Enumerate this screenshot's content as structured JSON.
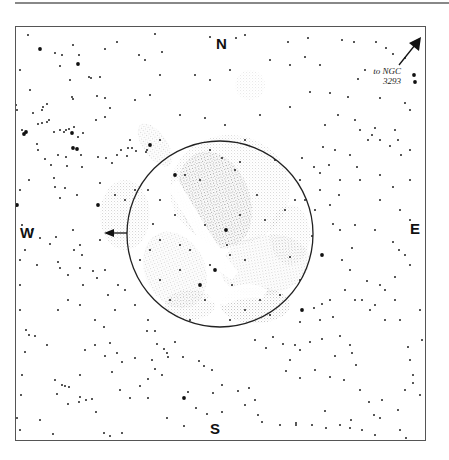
{
  "chart": {
    "title": "",
    "cardinals": {
      "north": "N",
      "south": "S",
      "east": "E",
      "west": "W"
    },
    "annotation": {
      "line1": "to NGC",
      "line2": "3293"
    },
    "field_circle": {
      "cx": 220,
      "cy": 234,
      "r": 93
    },
    "colors": {
      "ink": "#111111",
      "nebula": "#9a9a9a",
      "frame": "#555555"
    }
  },
  "stars": [
    [
      28,
      35,
      1
    ],
    [
      40,
      49,
      2
    ],
    [
      55,
      53,
      1
    ],
    [
      62,
      55,
      1
    ],
    [
      73,
      45,
      1
    ],
    [
      79,
      55,
      1
    ],
    [
      105,
      49,
      1
    ],
    [
      117,
      42,
      1
    ],
    [
      139,
      55,
      1
    ],
    [
      155,
      34,
      1
    ],
    [
      162,
      52,
      1
    ],
    [
      210,
      37,
      1
    ],
    [
      236,
      38,
      1
    ],
    [
      245,
      35,
      1
    ],
    [
      288,
      42,
      1
    ],
    [
      308,
      38,
      1
    ],
    [
      342,
      40,
      1
    ],
    [
      354,
      42,
      1
    ],
    [
      376,
      42,
      1
    ],
    [
      386,
      48,
      1
    ],
    [
      393,
      54,
      1
    ],
    [
      405,
      58,
      1
    ],
    [
      78,
      64,
      2
    ],
    [
      89,
      77,
      1
    ],
    [
      91,
      78,
      1
    ],
    [
      60,
      66,
      1
    ],
    [
      70,
      80,
      1
    ],
    [
      100,
      77,
      1
    ],
    [
      145,
      60,
      1
    ],
    [
      160,
      75,
      1
    ],
    [
      195,
      75,
      1
    ],
    [
      210,
      80,
      1
    ],
    [
      230,
      70,
      1
    ],
    [
      270,
      60,
      1
    ],
    [
      290,
      65,
      1
    ],
    [
      305,
      57,
      1
    ],
    [
      320,
      65,
      1
    ],
    [
      358,
      79,
      1
    ],
    [
      365,
      70,
      1
    ],
    [
      414,
      75,
      2
    ],
    [
      415,
      82,
      2
    ],
    [
      20,
      70,
      1
    ],
    [
      30,
      90,
      1
    ],
    [
      42,
      110,
      1
    ],
    [
      47,
      104,
      1
    ],
    [
      43,
      107,
      1
    ],
    [
      72,
      97,
      1
    ],
    [
      73,
      99,
      1
    ],
    [
      97,
      96,
      1
    ],
    [
      105,
      98,
      1
    ],
    [
      110,
      108,
      1
    ],
    [
      135,
      100,
      1
    ],
    [
      150,
      95,
      1
    ],
    [
      180,
      115,
      1
    ],
    [
      205,
      118,
      1
    ],
    [
      225,
      125,
      1
    ],
    [
      260,
      115,
      1
    ],
    [
      290,
      107,
      1
    ],
    [
      310,
      92,
      1
    ],
    [
      330,
      93,
      1
    ],
    [
      348,
      97,
      1
    ],
    [
      380,
      98,
      1
    ],
    [
      405,
      103,
      1
    ],
    [
      410,
      110,
      1
    ],
    [
      17,
      110,
      1
    ],
    [
      22,
      130,
      1
    ],
    [
      16,
      105,
      1
    ],
    [
      33,
      113,
      1
    ],
    [
      38,
      124,
      1
    ],
    [
      42,
      123,
      1
    ],
    [
      47,
      122,
      1
    ],
    [
      49,
      120,
      1
    ],
    [
      54,
      132,
      1
    ],
    [
      60,
      130,
      1
    ],
    [
      64,
      132,
      1
    ],
    [
      66,
      130,
      1
    ],
    [
      69,
      129,
      1
    ],
    [
      72,
      133,
      1
    ],
    [
      74,
      127,
      1
    ],
    [
      78,
      137,
      1
    ],
    [
      83,
      133,
      1
    ],
    [
      24,
      134,
      2
    ],
    [
      26,
      132,
      2
    ],
    [
      72,
      133,
      2
    ],
    [
      73,
      148,
      2
    ],
    [
      77,
      149,
      2
    ],
    [
      37,
      144,
      1
    ],
    [
      38,
      150,
      1
    ],
    [
      45,
      159,
      1
    ],
    [
      58,
      155,
      1
    ],
    [
      66,
      157,
      1
    ],
    [
      81,
      155,
      1
    ],
    [
      51,
      165,
      1
    ],
    [
      54,
      178,
      1
    ],
    [
      67,
      166,
      1
    ],
    [
      82,
      167,
      1
    ],
    [
      29,
      180,
      1
    ],
    [
      55,
      187,
      1
    ],
    [
      65,
      188,
      1
    ],
    [
      77,
      195,
      1
    ],
    [
      98,
      157,
      1
    ],
    [
      117,
      155,
      1
    ],
    [
      127,
      156,
      1
    ],
    [
      128,
      148,
      1
    ],
    [
      136,
      151,
      1
    ],
    [
      146,
      152,
      1
    ],
    [
      147,
      150,
      1
    ],
    [
      96,
      120,
      1
    ],
    [
      105,
      117,
      1
    ],
    [
      121,
      150,
      1
    ],
    [
      130,
      140,
      1
    ],
    [
      132,
      148,
      1
    ],
    [
      106,
      158,
      1
    ],
    [
      112,
      163,
      1
    ],
    [
      100,
      183,
      1
    ],
    [
      115,
      195,
      1
    ],
    [
      125,
      200,
      1
    ],
    [
      135,
      190,
      1
    ],
    [
      148,
      190,
      1
    ],
    [
      60,
      198,
      1
    ],
    [
      150,
      145,
      2
    ],
    [
      160,
      140,
      1
    ],
    [
      325,
      125,
      1
    ],
    [
      338,
      115,
      1
    ],
    [
      355,
      120,
      1
    ],
    [
      360,
      130,
      1
    ],
    [
      375,
      128,
      1
    ],
    [
      372,
      135,
      1
    ],
    [
      368,
      140,
      1
    ],
    [
      380,
      140,
      1
    ],
    [
      395,
      130,
      1
    ],
    [
      398,
      140,
      1
    ],
    [
      410,
      150,
      1
    ],
    [
      323,
      147,
      1
    ],
    [
      335,
      150,
      1
    ],
    [
      350,
      155,
      1
    ],
    [
      390,
      146,
      1
    ],
    [
      401,
      155,
      1
    ],
    [
      357,
      167,
      1
    ],
    [
      329,
      165,
      1
    ],
    [
      320,
      173,
      1
    ],
    [
      302,
      158,
      1
    ],
    [
      314,
      167,
      1
    ],
    [
      320,
      190,
      1
    ],
    [
      340,
      180,
      1
    ],
    [
      360,
      180,
      1
    ],
    [
      380,
      175,
      1
    ],
    [
      393,
      187,
      1
    ],
    [
      410,
      180,
      1
    ],
    [
      339,
      195,
      1
    ],
    [
      380,
      200,
      1
    ],
    [
      400,
      210,
      1
    ],
    [
      410,
      220,
      1
    ],
    [
      330,
      205,
      1
    ],
    [
      305,
      200,
      1
    ],
    [
      315,
      210,
      1
    ],
    [
      333,
      224,
      1
    ],
    [
      340,
      230,
      1
    ],
    [
      355,
      225,
      1
    ],
    [
      375,
      230,
      1
    ],
    [
      393,
      242,
      1
    ],
    [
      399,
      250,
      1
    ],
    [
      405,
      255,
      1
    ],
    [
      410,
      265,
      1
    ],
    [
      312,
      236,
      1
    ],
    [
      342,
      260,
      1
    ],
    [
      352,
      248,
      1
    ],
    [
      20,
      190,
      1
    ],
    [
      22,
      225,
      1
    ],
    [
      32,
      230,
      1
    ],
    [
      40,
      238,
      1
    ],
    [
      50,
      244,
      1
    ],
    [
      56,
      237,
      1
    ],
    [
      73,
      230,
      1
    ],
    [
      80,
      245,
      1
    ],
    [
      74,
      250,
      1
    ],
    [
      82,
      255,
      1
    ],
    [
      20,
      260,
      1
    ],
    [
      37,
      265,
      1
    ],
    [
      58,
      262,
      1
    ],
    [
      60,
      268,
      1
    ],
    [
      80,
      268,
      1
    ],
    [
      20,
      285,
      1
    ],
    [
      25,
      250,
      1
    ],
    [
      68,
      275,
      1
    ],
    [
      93,
      271,
      1
    ],
    [
      83,
      285,
      1
    ],
    [
      97,
      278,
      1
    ],
    [
      105,
      270,
      1
    ],
    [
      100,
      240,
      1
    ],
    [
      98,
      205,
      2
    ],
    [
      17,
      205,
      2
    ],
    [
      20,
      310,
      1
    ],
    [
      26,
      330,
      1
    ],
    [
      29,
      335,
      1
    ],
    [
      35,
      336,
      1
    ],
    [
      47,
      345,
      1
    ],
    [
      25,
      352,
      1
    ],
    [
      22,
      375,
      1
    ],
    [
      21,
      395,
      1
    ],
    [
      40,
      420,
      1
    ],
    [
      55,
      380,
      1
    ],
    [
      62,
      385,
      1
    ],
    [
      65,
      386,
      1
    ],
    [
      69,
      387,
      1
    ],
    [
      57,
      394,
      1
    ],
    [
      68,
      404,
      1
    ],
    [
      79,
      402,
      1
    ],
    [
      80,
      397,
      1
    ],
    [
      86,
      400,
      1
    ],
    [
      92,
      399,
      1
    ],
    [
      96,
      412,
      1
    ],
    [
      104,
      433,
      1
    ],
    [
      122,
      433,
      1
    ],
    [
      110,
      436,
      1
    ],
    [
      53,
      434,
      1
    ],
    [
      20,
      430,
      1
    ],
    [
      17,
      418,
      1
    ],
    [
      58,
      310,
      1
    ],
    [
      68,
      300,
      1
    ],
    [
      80,
      305,
      1
    ],
    [
      95,
      320,
      1
    ],
    [
      104,
      327,
      1
    ],
    [
      110,
      343,
      1
    ],
    [
      117,
      353,
      1
    ],
    [
      122,
      362,
      1
    ],
    [
      135,
      358,
      1
    ],
    [
      148,
      379,
      1
    ],
    [
      140,
      386,
      1
    ],
    [
      130,
      398,
      1
    ],
    [
      148,
      398,
      1
    ],
    [
      95,
      345,
      1
    ],
    [
      85,
      350,
      1
    ],
    [
      80,
      375,
      1
    ],
    [
      115,
      310,
      1
    ],
    [
      108,
      295,
      1
    ],
    [
      125,
      290,
      1
    ],
    [
      118,
      285,
      1
    ],
    [
      105,
      356,
      1
    ],
    [
      112,
      372,
      1
    ],
    [
      120,
      390,
      1
    ],
    [
      147,
      331,
      1
    ],
    [
      155,
      331,
      1
    ],
    [
      157,
      344,
      1
    ],
    [
      164,
      349,
      1
    ],
    [
      167,
      353,
      1
    ],
    [
      168,
      357,
      1
    ],
    [
      152,
      360,
      1
    ],
    [
      155,
      369,
      1
    ],
    [
      162,
      375,
      1
    ],
    [
      175,
      342,
      1
    ],
    [
      184,
      398,
      2
    ],
    [
      188,
      392,
      1
    ],
    [
      183,
      357,
      1
    ],
    [
      199,
      361,
      1
    ],
    [
      204,
      366,
      1
    ],
    [
      212,
      370,
      1
    ],
    [
      222,
      385,
      1
    ],
    [
      213,
      393,
      1
    ],
    [
      238,
      391,
      1
    ],
    [
      249,
      388,
      1
    ],
    [
      255,
      400,
      1
    ],
    [
      245,
      405,
      1
    ],
    [
      222,
      412,
      1
    ],
    [
      196,
      408,
      1
    ],
    [
      167,
      418,
      1
    ],
    [
      184,
      426,
      1
    ],
    [
      207,
      414,
      1
    ],
    [
      255,
      340,
      1
    ],
    [
      266,
      348,
      1
    ],
    [
      273,
      337,
      1
    ],
    [
      283,
      344,
      1
    ],
    [
      295,
      345,
      1
    ],
    [
      310,
      342,
      1
    ],
    [
      322,
      339,
      1
    ],
    [
      300,
      350,
      1
    ],
    [
      290,
      360,
      1
    ],
    [
      286,
      371,
      1
    ],
    [
      300,
      378,
      1
    ],
    [
      315,
      370,
      1
    ],
    [
      340,
      336,
      1
    ],
    [
      350,
      345,
      1
    ],
    [
      352,
      353,
      1
    ],
    [
      335,
      356,
      1
    ],
    [
      330,
      377,
      1
    ],
    [
      356,
      365,
      1
    ],
    [
      344,
      380,
      1
    ],
    [
      360,
      390,
      1
    ],
    [
      369,
      402,
      1
    ],
    [
      382,
      400,
      1
    ],
    [
      374,
      415,
      1
    ],
    [
      351,
      420,
      1
    ],
    [
      326,
      428,
      1
    ],
    [
      350,
      428,
      1
    ],
    [
      380,
      418,
      1
    ],
    [
      398,
      410,
      1
    ],
    [
      405,
      390,
      1
    ],
    [
      413,
      383,
      1
    ],
    [
      413,
      375,
      1
    ],
    [
      410,
      360,
      1
    ],
    [
      408,
      347,
      1
    ],
    [
      258,
      415,
      1
    ],
    [
      262,
      422,
      1
    ],
    [
      280,
      425,
      1
    ],
    [
      296,
      423,
      1
    ],
    [
      296,
      425,
      1
    ],
    [
      312,
      425,
      1
    ],
    [
      325,
      411,
      1
    ],
    [
      340,
      425,
      1
    ],
    [
      362,
      430,
      1
    ],
    [
      375,
      435,
      1
    ],
    [
      400,
      430,
      1
    ],
    [
      406,
      438,
      1
    ],
    [
      420,
      395,
      1
    ],
    [
      422,
      340,
      1
    ],
    [
      420,
      310,
      1
    ],
    [
      400,
      320,
      1
    ],
    [
      385,
      290,
      1
    ],
    [
      395,
      300,
      1
    ],
    [
      375,
      305,
      1
    ],
    [
      362,
      300,
      1
    ],
    [
      380,
      285,
      1
    ],
    [
      395,
      277,
      1
    ],
    [
      367,
      281,
      1
    ],
    [
      345,
      290,
      1
    ],
    [
      355,
      300,
      1
    ],
    [
      330,
      300,
      1
    ],
    [
      333,
      317,
      1
    ],
    [
      314,
      308,
      1
    ],
    [
      322,
      304,
      1
    ],
    [
      300,
      322,
      1
    ],
    [
      320,
      320,
      1
    ],
    [
      322,
      255,
      2
    ],
    [
      302,
      310,
      2
    ],
    [
      350,
      270,
      1
    ],
    [
      370,
      310,
      1
    ],
    [
      385,
      320,
      1
    ],
    [
      200,
      285,
      2
    ],
    [
      210,
      265,
      1
    ],
    [
      226,
      230,
      2
    ],
    [
      215,
      270,
      2
    ],
    [
      205,
      300,
      1
    ],
    [
      190,
      250,
      1
    ],
    [
      175,
      215,
      1
    ],
    [
      180,
      245,
      1
    ],
    [
      185,
      175,
      1
    ],
    [
      200,
      180,
      1
    ],
    [
      240,
      162,
      1
    ],
    [
      257,
      195,
      1
    ],
    [
      265,
      220,
      1
    ],
    [
      285,
      210,
      1
    ],
    [
      295,
      200,
      1
    ],
    [
      290,
      257,
      1
    ],
    [
      280,
      295,
      1
    ],
    [
      260,
      300,
      1
    ],
    [
      232,
      285,
      1
    ],
    [
      230,
      255,
      1
    ],
    [
      245,
      260,
      1
    ],
    [
      160,
      200,
      1
    ],
    [
      150,
      250,
      1
    ],
    [
      160,
      280,
      1
    ],
    [
      170,
      300,
      1
    ],
    [
      148,
      320,
      1
    ],
    [
      135,
      305,
      1
    ],
    [
      190,
      320,
      1
    ],
    [
      230,
      320,
      1
    ],
    [
      245,
      310,
      1
    ],
    [
      270,
      315,
      1
    ],
    [
      300,
      280,
      1
    ],
    [
      210,
      150,
      1
    ],
    [
      222,
      158,
      1
    ],
    [
      235,
      170,
      1
    ],
    [
      245,
      140,
      1
    ],
    [
      275,
      160,
      1
    ],
    [
      175,
      175,
      2
    ],
    [
      300,
      180,
      1
    ],
    [
      153,
      224,
      1
    ],
    [
      160,
      240,
      1
    ],
    [
      140,
      260,
      1
    ],
    [
      180,
      270,
      1
    ],
    [
      205,
      225,
      1
    ],
    [
      227,
      245,
      1
    ],
    [
      240,
      215,
      1
    ]
  ],
  "nebula_patches": [
    {
      "cx": 215,
      "cy": 200,
      "rx": 35,
      "ry": 50,
      "rot": -20,
      "opacity": 0.55
    },
    {
      "cx": 230,
      "cy": 190,
      "rx": 60,
      "ry": 55,
      "rot": 0,
      "opacity": 0.25
    },
    {
      "cx": 265,
      "cy": 265,
      "rx": 45,
      "ry": 30,
      "rot": -10,
      "opacity": 0.3
    },
    {
      "cx": 255,
      "cy": 305,
      "rx": 35,
      "ry": 18,
      "rot": 0,
      "opacity": 0.4
    },
    {
      "cx": 175,
      "cy": 270,
      "rx": 30,
      "ry": 40,
      "rot": -25,
      "opacity": 0.3
    },
    {
      "cx": 125,
      "cy": 215,
      "rx": 25,
      "ry": 35,
      "rot": 0,
      "opacity": 0.28
    },
    {
      "cx": 155,
      "cy": 145,
      "rx": 12,
      "ry": 25,
      "rot": -35,
      "opacity": 0.3
    },
    {
      "cx": 190,
      "cy": 305,
      "rx": 25,
      "ry": 15,
      "rot": 0,
      "opacity": 0.3
    },
    {
      "cx": 290,
      "cy": 235,
      "rx": 20,
      "ry": 30,
      "rot": 0,
      "opacity": 0.25
    },
    {
      "cx": 250,
      "cy": 85,
      "rx": 15,
      "ry": 15,
      "rot": 0,
      "opacity": 0.15
    }
  ]
}
